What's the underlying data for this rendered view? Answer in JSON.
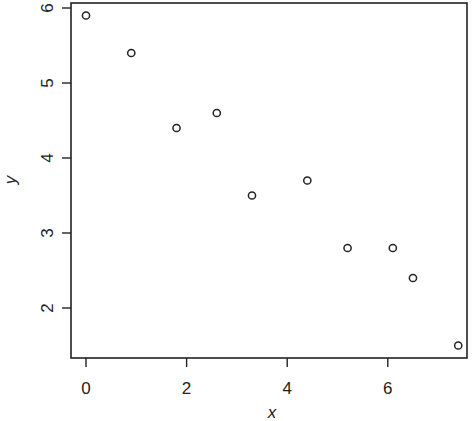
{
  "chart_data": {
    "type": "scatter",
    "title": "",
    "xlabel": "x",
    "ylabel": "y",
    "xlim": [
      -0.3,
      7.6
    ],
    "ylim": [
      1.33,
      6.07
    ],
    "xticks": [
      0,
      2,
      4,
      6
    ],
    "yticks": [
      2,
      3,
      4,
      5,
      6
    ],
    "xtick_labels": [
      "0",
      "2",
      "4",
      "6"
    ],
    "ytick_labels": [
      "2",
      "3",
      "4",
      "5",
      "6"
    ],
    "grid": false,
    "legend": null,
    "marker": "open-circle",
    "series": [
      {
        "name": "data",
        "x": [
          0,
          0.9,
          1.8,
          2.6,
          3.3,
          4.4,
          5.2,
          6.1,
          6.5,
          7.4
        ],
        "y": [
          5.9,
          5.4,
          4.4,
          4.6,
          3.5,
          3.7,
          2.8,
          2.8,
          2.4,
          1.5
        ]
      }
    ]
  },
  "colors": {
    "axis": "#222222",
    "marker": "#222222",
    "background": "#ffffff"
  }
}
